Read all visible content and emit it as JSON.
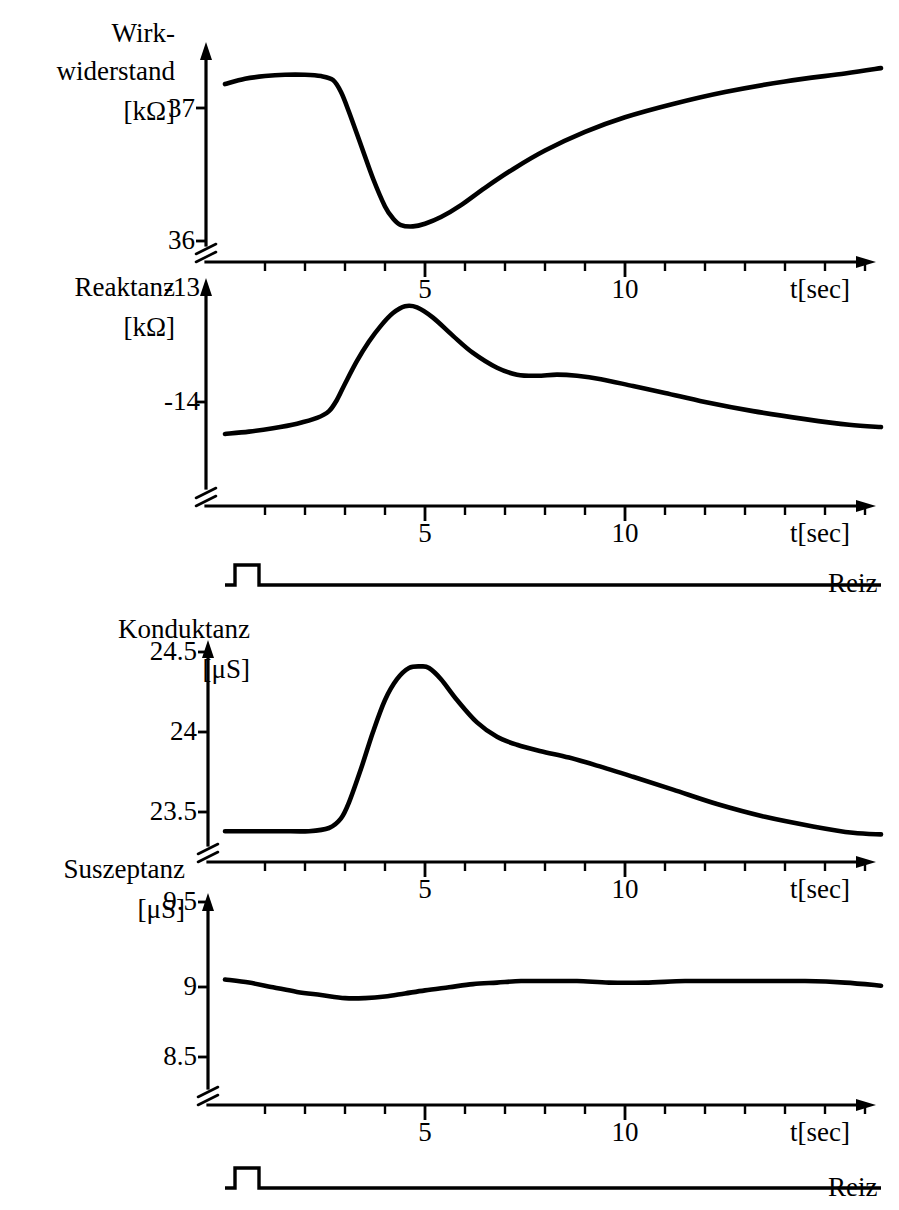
{
  "figure": {
    "background": "#ffffff",
    "ink_color": "#000000",
    "language": "de"
  },
  "chart_data": [
    {
      "type": "line",
      "panel_index": 0,
      "title": "",
      "ylabel": "Wirk-\nwiderstand\n[kΩ]",
      "ylabel_lines": [
        "Wirk-",
        "widerstand",
        "[kΩ]"
      ],
      "xlabel": "t[sec]",
      "yunit": "kΩ",
      "ylim": [
        36.0,
        37.5
      ],
      "yticks": [
        36,
        37
      ],
      "ytick_labels": [
        "36",
        "37"
      ],
      "axis_break": true,
      "xlim": [
        0,
        16.5
      ],
      "xticks": [
        1,
        2,
        3,
        4,
        5,
        6,
        7,
        8,
        9,
        10,
        11,
        12,
        13,
        14,
        15,
        16
      ],
      "xtick_labels_shown": {
        "5": "5",
        "10": "10"
      },
      "grid": false,
      "legend": null,
      "series": [
        {
          "name": "Wirkwiderstand",
          "x": [
            0.0,
            0.5,
            1.0,
            1.5,
            2.0,
            2.4,
            2.7,
            2.9,
            3.1,
            3.4,
            3.7,
            4.0,
            4.2,
            4.4,
            4.7,
            5.0,
            5.4,
            5.9,
            6.5,
            7.2,
            8.0,
            9.0,
            10.0,
            11.2,
            12.5,
            14.0,
            15.5,
            16.4
          ],
          "y": [
            37.18,
            37.22,
            37.24,
            37.25,
            37.25,
            37.24,
            37.21,
            37.12,
            36.97,
            36.72,
            36.47,
            36.26,
            36.17,
            36.12,
            36.11,
            36.13,
            36.18,
            36.27,
            36.4,
            36.54,
            36.68,
            36.82,
            36.93,
            37.03,
            37.12,
            37.2,
            37.26,
            37.3
          ]
        }
      ]
    },
    {
      "type": "line",
      "panel_index": 1,
      "title": "",
      "ylabel": "Reaktanz\n[kΩ]",
      "ylabel_lines": [
        "Reaktanz",
        "[kΩ]"
      ],
      "xlabel": "t[sec]",
      "yunit": "kΩ",
      "ylim": [
        -14.6,
        -12.95
      ],
      "yticks": [
        -14,
        -13
      ],
      "ytick_labels": [
        "-14",
        "-13"
      ],
      "axis_break": true,
      "xlim": [
        0,
        16.5
      ],
      "xticks": [
        1,
        2,
        3,
        4,
        5,
        6,
        7,
        8,
        9,
        10,
        11,
        12,
        13,
        14,
        15,
        16
      ],
      "xtick_labels_shown": {
        "5": "5",
        "10": "10"
      },
      "grid": false,
      "legend": null,
      "series": [
        {
          "name": "Reaktanz",
          "x": [
            0.0,
            0.6,
            1.2,
            1.8,
            2.3,
            2.6,
            2.8,
            3.0,
            3.3,
            3.6,
            3.9,
            4.2,
            4.5,
            4.8,
            5.2,
            5.7,
            6.2,
            6.8,
            7.3,
            7.8,
            8.3,
            8.8,
            9.4,
            10.2,
            11.0,
            12.0,
            13.2,
            14.5,
            15.6,
            16.4
          ],
          "y": [
            -14.28,
            -14.26,
            -14.23,
            -14.19,
            -14.14,
            -14.08,
            -13.98,
            -13.84,
            -13.64,
            -13.47,
            -13.33,
            -13.22,
            -13.16,
            -13.17,
            -13.26,
            -13.42,
            -13.57,
            -13.7,
            -13.76,
            -13.77,
            -13.76,
            -13.77,
            -13.8,
            -13.86,
            -13.92,
            -14.0,
            -14.08,
            -14.15,
            -14.2,
            -14.22
          ]
        }
      ]
    },
    {
      "type": "line",
      "panel_index": 2,
      "title": "",
      "ylabel": "Konduktanz\n[μS]",
      "ylabel_lines": [
        "Konduktanz",
        "[μS]"
      ],
      "xlabel": "t[sec]",
      "yunit": "μS",
      "ylim": [
        23.2,
        24.62
      ],
      "yticks": [
        23.5,
        24,
        24.5
      ],
      "ytick_labels": [
        "23.5",
        "24",
        "24.5"
      ],
      "axis_break": true,
      "xlim": [
        0,
        16.5
      ],
      "xticks": [
        1,
        2,
        3,
        4,
        5,
        6,
        7,
        8,
        9,
        10,
        11,
        12,
        13,
        14,
        15,
        16
      ],
      "xtick_labels_shown": {
        "5": "5",
        "10": "10"
      },
      "grid": false,
      "legend": null,
      "series": [
        {
          "name": "Konduktanz",
          "x": [
            0.0,
            0.7,
            1.4,
            2.1,
            2.6,
            2.9,
            3.1,
            3.4,
            3.7,
            4.0,
            4.3,
            4.6,
            4.9,
            5.1,
            5.4,
            5.8,
            6.3,
            6.8,
            7.3,
            7.9,
            8.6,
            9.3,
            10.2,
            11.2,
            12.3,
            13.5,
            14.7,
            15.7,
            16.4
          ],
          "y": [
            23.38,
            23.38,
            23.38,
            23.38,
            23.4,
            23.46,
            23.56,
            23.77,
            24.0,
            24.2,
            24.33,
            24.4,
            24.41,
            24.4,
            24.33,
            24.2,
            24.06,
            23.97,
            23.92,
            23.88,
            23.84,
            23.79,
            23.72,
            23.64,
            23.55,
            23.47,
            23.41,
            23.37,
            23.36
          ]
        }
      ]
    },
    {
      "type": "line",
      "panel_index": 3,
      "title": "",
      "ylabel": "Suszeptanz\n[μS]",
      "ylabel_lines": [
        "Suszeptanz",
        "[μS]"
      ],
      "xlabel": "t[sec]",
      "yunit": "μS",
      "ylim": [
        8.35,
        9.68
      ],
      "yticks": [
        8.5,
        9,
        9.5
      ],
      "ytick_labels": [
        "8.5",
        "9",
        "9.5"
      ],
      "axis_break": true,
      "xlim": [
        0,
        16.5
      ],
      "xticks": [
        1,
        2,
        3,
        4,
        5,
        6,
        7,
        8,
        9,
        10,
        11,
        12,
        13,
        14,
        15,
        16
      ],
      "xtick_labels_shown": {
        "5": "5",
        "10": "10"
      },
      "grid": false,
      "legend": null,
      "series": [
        {
          "name": "Suszeptanz",
          "x": [
            0.0,
            0.6,
            1.2,
            1.8,
            2.4,
            3.0,
            3.5,
            4.0,
            4.5,
            5.0,
            5.6,
            6.2,
            6.8,
            7.4,
            8.0,
            8.8,
            9.6,
            10.5,
            11.5,
            12.5,
            13.5,
            14.5,
            15.5,
            16.4
          ],
          "y": [
            9.0,
            8.98,
            8.95,
            8.92,
            8.9,
            8.88,
            8.88,
            8.89,
            8.91,
            8.93,
            8.95,
            8.97,
            8.98,
            8.99,
            8.99,
            8.99,
            8.98,
            8.98,
            8.99,
            8.99,
            8.99,
            8.99,
            8.98,
            8.96
          ]
        }
      ]
    },
    {
      "type": "line",
      "panel_index": 4,
      "title": "",
      "ylabel": "",
      "xlabel": "",
      "name": "Reiz",
      "label": "Reiz",
      "description": "stimulus pulse trace",
      "xlim": [
        0,
        16.5
      ],
      "grid": false,
      "series": [
        {
          "name": "Reiz",
          "pulse_start_sec": 0.25,
          "pulse_end_sec": 0.85,
          "baseline": 0,
          "amplitude": 1,
          "x": [
            0.0,
            0.25,
            0.25,
            0.85,
            0.85,
            16.4
          ],
          "y": [
            0,
            0,
            1,
            1,
            0,
            0
          ]
        }
      ]
    },
    {
      "type": "line",
      "panel_index": 5,
      "title": "",
      "ylabel": "",
      "xlabel": "",
      "name": "Reiz",
      "label": "Reiz",
      "description": "stimulus pulse trace",
      "xlim": [
        0,
        16.5
      ],
      "grid": false,
      "series": [
        {
          "name": "Reiz",
          "pulse_start_sec": 0.25,
          "pulse_end_sec": 0.85,
          "baseline": 0,
          "amplitude": 1,
          "x": [
            0.0,
            0.25,
            0.25,
            0.85,
            0.85,
            16.4
          ],
          "y": [
            0,
            0,
            1,
            1,
            0,
            0
          ]
        }
      ]
    }
  ],
  "labels": {
    "panel1_title_line1": "Wirk-",
    "panel1_title_line2": "widerstand",
    "panel1_unit": "[kΩ]",
    "panel1_ytick_top": "37",
    "panel1_ytick_bottom": "36",
    "panel1_xtick_5": "5",
    "panel1_xtick_10": "10",
    "panel1_xaxis_title": "t[sec]",
    "panel2_title": "Reaktanz",
    "panel2_unit": "[kΩ]",
    "panel2_ytick_top": "-13",
    "panel2_ytick_mid": "-14",
    "panel2_xtick_5": "5",
    "panel2_xtick_10": "10",
    "panel2_xaxis_title": "t[sec]",
    "stim1_label": "Reiz",
    "panel3_title": "Konduktanz",
    "panel3_unit": "[μS]",
    "panel3_ytick_top": "24.5",
    "panel3_ytick_mid": "24",
    "panel3_ytick_bottom": "23.5",
    "panel3_xtick_5": "5",
    "panel3_xtick_10": "10",
    "panel3_xaxis_title": "t[sec]",
    "panel4_title": "Suszeptanz",
    "panel4_unit": "[μS]",
    "panel4_ytick_top": "9.5",
    "panel4_ytick_mid": "9",
    "panel4_ytick_bottom": "8.5",
    "panel4_xtick_5": "5",
    "panel4_xtick_10": "10",
    "panel4_xaxis_title": "t[sec]",
    "stim2_label": "Reiz"
  }
}
